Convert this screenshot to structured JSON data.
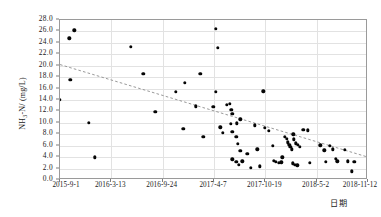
{
  "chart_data": {
    "type": "scatter",
    "title": "",
    "xlabel": "日期",
    "ylabel": "NH3-N/ (mg/L)",
    "ylabel_parts": {
      "head": "NH",
      "sub": "3",
      "tail": "-N/ (mg/L)"
    },
    "grid": true,
    "legend": null,
    "ylim": [
      0.0,
      28.0
    ],
    "ytick_step": 2.0,
    "yticks": [
      "0.0",
      "2.0",
      "4.0",
      "6.0",
      "8.0",
      "10.0",
      "12.0",
      "14.0",
      "16.0",
      "18.0",
      "20.0",
      "22.0",
      "24.0",
      "26.0",
      "28.0"
    ],
    "ytick_values": [
      0,
      2,
      4,
      6,
      8,
      10,
      12,
      14,
      16,
      18,
      20,
      22,
      24,
      26,
      28
    ],
    "xticks": [
      "2015-9-1",
      "2016-3-13",
      "2016-9-24",
      "2017-4-7",
      "2017-10-19",
      "2018-5-2",
      "2018-11-12"
    ],
    "xtick_positions": [
      0,
      0.1667,
      0.3333,
      0.5,
      0.6667,
      0.8333,
      1.0
    ],
    "xlim_labels": [
      "2015-9-1",
      "2018-11-12"
    ],
    "marker": {
      "shape": "circle",
      "color": "#050505",
      "size": 3.4
    },
    "trendline": {
      "style": "dashed",
      "color": "#8d8d8d",
      "x_start": 0.0,
      "y_start": 20.2,
      "x_end": 1.0,
      "y_end": 4.0
    },
    "series": [
      {
        "name": "NH3-N",
        "points": [
          {
            "x": 0.0,
            "y": 14.0
          },
          {
            "x": 0.03,
            "y": 24.8
          },
          {
            "x": 0.046,
            "y": 26.2
          },
          {
            "x": 0.033,
            "y": 17.5
          },
          {
            "x": 0.093,
            "y": 10.0
          },
          {
            "x": 0.113,
            "y": 4.0
          },
          {
            "x": 0.23,
            "y": 23.3
          },
          {
            "x": 0.27,
            "y": 18.6
          },
          {
            "x": 0.31,
            "y": 11.9
          },
          {
            "x": 0.375,
            "y": 15.4
          },
          {
            "x": 0.4,
            "y": 9.0
          },
          {
            "x": 0.405,
            "y": 17.0
          },
          {
            "x": 0.44,
            "y": 12.9
          },
          {
            "x": 0.465,
            "y": 7.6
          },
          {
            "x": 0.505,
            "y": 26.5
          },
          {
            "x": 0.512,
            "y": 23.1
          },
          {
            "x": 0.455,
            "y": 18.6
          },
          {
            "x": 0.498,
            "y": 12.8
          },
          {
            "x": 0.505,
            "y": 15.4
          },
          {
            "x": 0.542,
            "y": 13.2
          },
          {
            "x": 0.552,
            "y": 13.3
          },
          {
            "x": 0.556,
            "y": 12.3
          },
          {
            "x": 0.56,
            "y": 11.6
          },
          {
            "x": 0.575,
            "y": 9.9
          },
          {
            "x": 0.585,
            "y": 10.6
          },
          {
            "x": 0.555,
            "y": 9.8
          },
          {
            "x": 0.56,
            "y": 8.4
          },
          {
            "x": 0.572,
            "y": 7.6
          },
          {
            "x": 0.578,
            "y": 6.3
          },
          {
            "x": 0.585,
            "y": 5.1
          },
          {
            "x": 0.56,
            "y": 3.6
          },
          {
            "x": 0.572,
            "y": 3.2
          },
          {
            "x": 0.58,
            "y": 2.7
          },
          {
            "x": 0.592,
            "y": 3.3
          },
          {
            "x": 0.608,
            "y": 4.6
          },
          {
            "x": 0.62,
            "y": 2.1
          },
          {
            "x": 0.633,
            "y": 9.6
          },
          {
            "x": 0.66,
            "y": 15.5
          },
          {
            "x": 0.665,
            "y": 9.1
          },
          {
            "x": 0.678,
            "y": 8.6
          },
          {
            "x": 0.69,
            "y": 6.0
          },
          {
            "x": 0.694,
            "y": 3.4
          },
          {
            "x": 0.7,
            "y": 3.2
          },
          {
            "x": 0.71,
            "y": 3.0
          },
          {
            "x": 0.718,
            "y": 3.1
          },
          {
            "x": 0.722,
            "y": 4.0
          },
          {
            "x": 0.73,
            "y": 7.6
          },
          {
            "x": 0.737,
            "y": 7.2
          },
          {
            "x": 0.74,
            "y": 6.6
          },
          {
            "x": 0.744,
            "y": 6.2
          },
          {
            "x": 0.748,
            "y": 5.8
          },
          {
            "x": 0.752,
            "y": 5.4
          },
          {
            "x": 0.757,
            "y": 8.0
          },
          {
            "x": 0.76,
            "y": 7.1
          },
          {
            "x": 0.765,
            "y": 6.4
          },
          {
            "x": 0.772,
            "y": 6.2
          },
          {
            "x": 0.778,
            "y": 5.8
          },
          {
            "x": 0.755,
            "y": 2.9
          },
          {
            "x": 0.762,
            "y": 2.7
          },
          {
            "x": 0.77,
            "y": 2.6
          },
          {
            "x": 0.79,
            "y": 8.8
          },
          {
            "x": 0.805,
            "y": 8.7
          },
          {
            "x": 0.812,
            "y": 3.0
          },
          {
            "x": 0.845,
            "y": 6.1
          },
          {
            "x": 0.858,
            "y": 5.2
          },
          {
            "x": 0.862,
            "y": 3.2
          },
          {
            "x": 0.875,
            "y": 6.0
          },
          {
            "x": 0.885,
            "y": 5.4
          },
          {
            "x": 0.895,
            "y": 3.7
          },
          {
            "x": 0.9,
            "y": 3.3
          },
          {
            "x": 0.925,
            "y": 5.3
          },
          {
            "x": 0.935,
            "y": 3.3
          },
          {
            "x": 0.948,
            "y": 1.5
          },
          {
            "x": 0.955,
            "y": 3.2
          },
          {
            "x": 0.64,
            "y": 5.4
          },
          {
            "x": 0.648,
            "y": 2.4
          },
          {
            "x": 0.52,
            "y": 9.2
          },
          {
            "x": 0.528,
            "y": 8.3
          }
        ]
      }
    ]
  }
}
